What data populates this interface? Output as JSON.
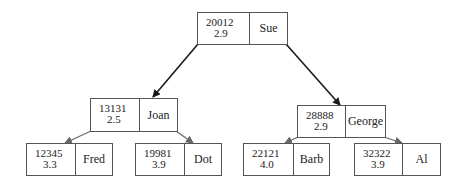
{
  "diagram": {
    "type": "binary-search-tree",
    "nodes": {
      "root": {
        "id": "20012",
        "gpa": "2.9",
        "name": "Sue"
      },
      "l": {
        "id": "13131",
        "gpa": "2.5",
        "name": "Joan"
      },
      "r": {
        "id": "28888",
        "gpa": "2.9",
        "name": "George"
      },
      "ll": {
        "id": "12345",
        "gpa": "3.3",
        "name": "Fred"
      },
      "lr": {
        "id": "19981",
        "gpa": "3.9",
        "name": "Dot"
      },
      "rl": {
        "id": "22121",
        "gpa": "4.0",
        "name": "Barb"
      },
      "rr": {
        "id": "32322",
        "gpa": "3.9",
        "name": "Al"
      }
    },
    "edges": [
      {
        "from": "root",
        "to": "l"
      },
      {
        "from": "root",
        "to": "r"
      },
      {
        "from": "l",
        "to": "ll"
      },
      {
        "from": "l",
        "to": "lr"
      },
      {
        "from": "r",
        "to": "rl"
      },
      {
        "from": "r",
        "to": "rr"
      }
    ],
    "colors": {
      "upper_edges": "#1a1a1a",
      "lower_edges": "#666666",
      "border": "#555555"
    }
  }
}
